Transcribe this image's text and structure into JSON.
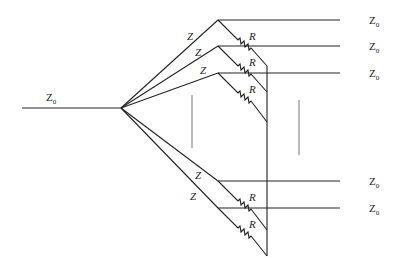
{
  "diagram": {
    "title": "",
    "input_port": {
      "label": "Z",
      "subscript": "0"
    },
    "branch_impedance_label": "Z",
    "resistor_label": "R",
    "output_ports": [
      {
        "label": "Z",
        "subscript": "0"
      },
      {
        "label": "Z",
        "subscript": "0"
      },
      {
        "label": "Z",
        "subscript": "0"
      },
      {
        "label": "Z",
        "subscript": "0"
      },
      {
        "label": "Z",
        "subscript": "0"
      }
    ],
    "branches": [
      {
        "z_label": "Z",
        "r_label": "R"
      },
      {
        "z_label": "Z",
        "r_label": "R"
      },
      {
        "z_label": "Z",
        "r_label": "R"
      },
      {
        "z_label": "Z",
        "r_label": "R"
      },
      {
        "z_label": "Z",
        "r_label": "R"
      }
    ]
  }
}
